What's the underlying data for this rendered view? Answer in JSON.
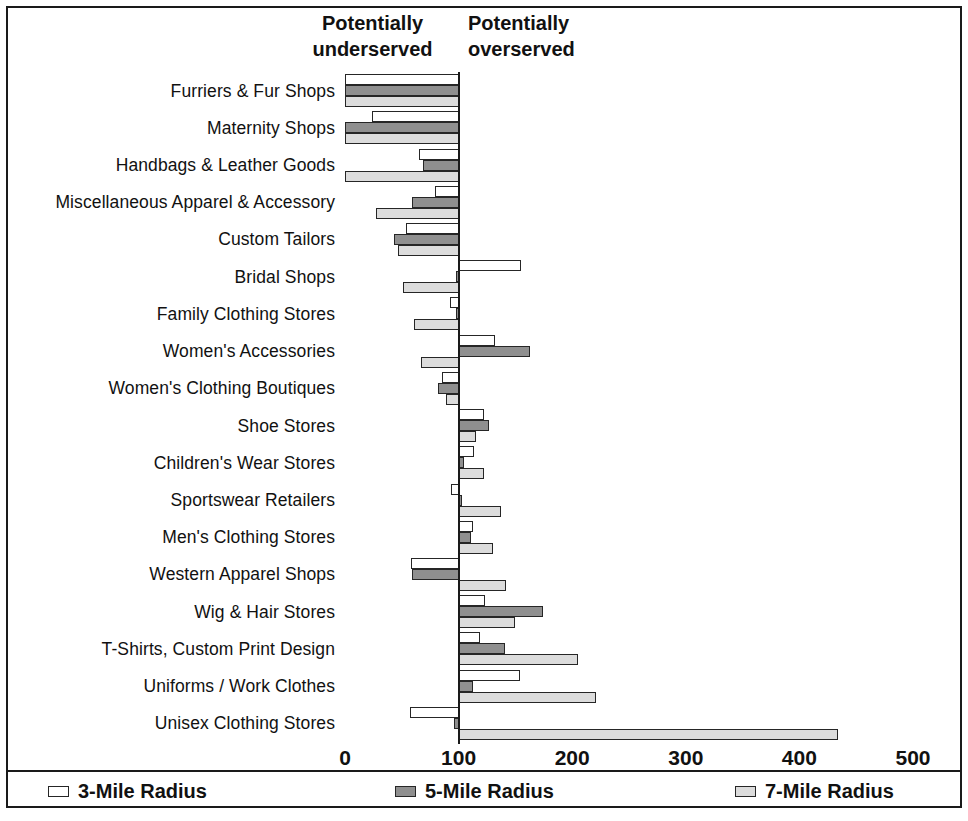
{
  "headers": {
    "left": "Potentially\nunderserved",
    "right": "Potentially\noverserved"
  },
  "legend": [
    {
      "label": "3-Mile Radius",
      "color": "#ffffff"
    },
    {
      "label": "5-Mile Radius",
      "color": "#8f8f8f"
    },
    {
      "label": "7-Mile Radius",
      "color": "#dcdcdc"
    }
  ],
  "axis": {
    "ticks": [
      "0",
      "100",
      "200",
      "300",
      "400",
      "500"
    ],
    "tick_values": [
      0,
      100,
      200,
      300,
      400,
      500
    ],
    "baseline_value": 100
  },
  "chart_data": {
    "type": "bar",
    "orientation": "horizontal",
    "title": "",
    "subtitle": "",
    "xlabel": "",
    "ylabel": "",
    "xlim": [
      0,
      500
    ],
    "grid": false,
    "baseline": 100,
    "annotations": [
      "Potentially underserved",
      "Potentially overserved"
    ],
    "legend_position": "bottom",
    "categories": [
      "Furriers & Fur Shops",
      "Maternity Shops",
      "Handbags & Leather Goods",
      "Miscellaneous Apparel & Accessory",
      "Custom Tailors",
      "Bridal Shops",
      "Family Clothing Stores",
      "Women's Accessories",
      "Women's Clothing Boutiques",
      "Shoe Stores",
      "Children's Wear Stores",
      "Sportswear Retailers",
      "Men's Clothing Stores",
      "Western Apparel Shops",
      "Wig & Hair Stores",
      "T-Shirts, Custom Print Design",
      "Uniforms / Work Clothes",
      "Unisex Clothing Stores"
    ],
    "series": [
      {
        "name": "3-Mile Radius",
        "color": "#ffffff",
        "values": [
          0,
          24,
          65,
          79,
          54,
          155,
          92,
          132,
          85,
          122,
          114,
          93,
          113,
          58,
          123,
          119,
          154,
          57
        ]
      },
      {
        "name": "5-Mile Radius",
        "color": "#8f8f8f",
        "values": [
          0,
          0,
          69,
          59,
          43,
          98,
          98,
          163,
          82,
          127,
          105,
          101,
          111,
          59,
          174,
          141,
          113,
          96
        ]
      },
      {
        "name": "7-Mile Radius",
        "color": "#dcdcdc",
        "values": [
          0,
          0,
          0,
          27,
          47,
          51,
          61,
          67,
          89,
          115,
          122,
          137,
          130,
          142,
          150,
          205,
          221,
          434
        ]
      }
    ]
  }
}
